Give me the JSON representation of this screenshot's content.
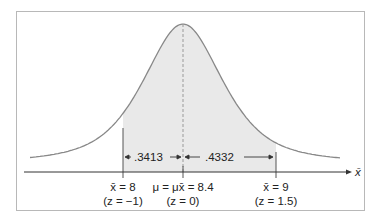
{
  "panel": {
    "label": ""
  },
  "chart_data": {
    "type": "area",
    "title": "",
    "distribution": "normal",
    "mean": 8.4,
    "xlabel": "x̄",
    "ylabel": "",
    "shaded_range": [
      8,
      9
    ],
    "markers": [
      {
        "x": 8,
        "label": "x̄ = 8",
        "z_label": "(z = −1)"
      },
      {
        "x": 8.4,
        "label": "μ = μx̄ = 8.4",
        "z_label": "(z = 0)"
      },
      {
        "x": 9,
        "label": "x̄ = 9",
        "z_label": "(z = 1.5)"
      }
    ],
    "areas": [
      {
        "from": 8,
        "to": 8.4,
        "value": 0.3413,
        "label": ".3413"
      },
      {
        "from": 8.4,
        "to": 9,
        "value": 0.4332,
        "label": ".4332"
      }
    ],
    "grid": false
  },
  "colors": {
    "curve": "#888888",
    "shade": "#e9e9e9",
    "axis": "#333333",
    "frame": "#b8b8b8"
  }
}
